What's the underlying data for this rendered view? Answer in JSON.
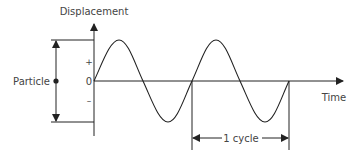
{
  "diagram": {
    "y_axis_label": "Displacement",
    "x_axis_label": "Time",
    "plus_label": "+",
    "zero_label": "0",
    "minus_label": "–",
    "particle_label": "Particle",
    "cycle_label": "1 cycle",
    "line_color": "#222222",
    "text_color": "#444444"
  }
}
